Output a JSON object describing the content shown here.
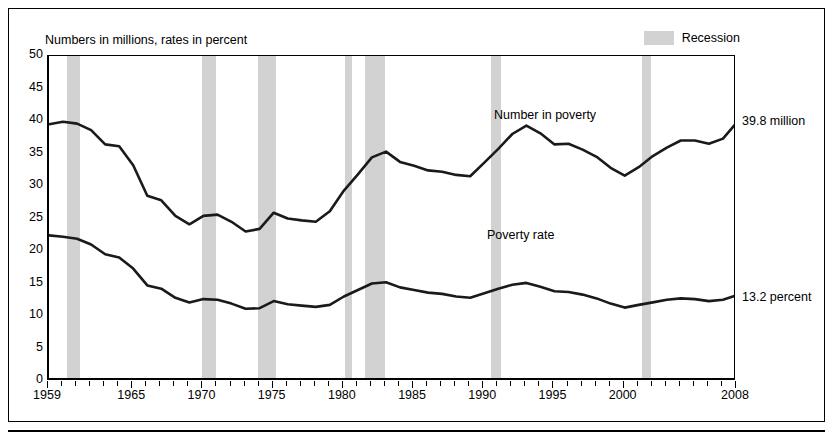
{
  "figure": {
    "subtitle": "Numbers in millions, rates in percent",
    "legend": {
      "label": "Recession",
      "swatch_color": "#d2d2d2"
    },
    "annotations": {
      "number_label": "Number in poverty",
      "rate_label": "Poverty rate",
      "number_end": "39.8 million",
      "rate_end": "13.2 percent"
    }
  },
  "chart_data": {
    "type": "line",
    "title": "",
    "subtitle": "Numbers in millions, rates in percent",
    "xlabel": "",
    "ylabel": "",
    "xlim": [
      1959,
      2008
    ],
    "ylim": [
      0,
      50
    ],
    "ytick_labels": [
      "0",
      "5",
      "10",
      "15",
      "20",
      "25",
      "30",
      "35",
      "40",
      "45",
      "50"
    ],
    "ytick_values": [
      0,
      5,
      10,
      15,
      20,
      25,
      30,
      35,
      40,
      45,
      50
    ],
    "xtick_labels": [
      "1959",
      "1965",
      "1970",
      "1975",
      "1980",
      "1985",
      "1990",
      "1995",
      "2000",
      "2008"
    ],
    "xtick_values": [
      1959,
      1965,
      1970,
      1975,
      1980,
      1985,
      1990,
      1995,
      2000,
      2008
    ],
    "grid": false,
    "legend_position": "top-right",
    "x": [
      1959,
      1960,
      1961,
      1962,
      1963,
      1964,
      1965,
      1966,
      1967,
      1968,
      1969,
      1970,
      1971,
      1972,
      1973,
      1974,
      1975,
      1976,
      1977,
      1978,
      1979,
      1980,
      1981,
      1982,
      1983,
      1984,
      1985,
      1986,
      1987,
      1988,
      1989,
      1990,
      1991,
      1992,
      1993,
      1994,
      1995,
      1996,
      1997,
      1998,
      1999,
      2000,
      2001,
      2002,
      2003,
      2004,
      2005,
      2006,
      2007,
      2008
    ],
    "series": [
      {
        "name": "Number in poverty",
        "unit": "millions",
        "end_label": "39.8 million",
        "values": [
          39.5,
          39.9,
          39.6,
          38.6,
          36.4,
          36.1,
          33.2,
          28.5,
          27.8,
          25.4,
          24.1,
          25.4,
          25.6,
          24.5,
          23.0,
          23.4,
          25.9,
          25.0,
          24.7,
          24.5,
          26.1,
          29.3,
          31.8,
          34.4,
          35.3,
          33.7,
          33.1,
          32.4,
          32.2,
          31.7,
          31.5,
          33.6,
          35.7,
          38.0,
          39.3,
          38.1,
          36.4,
          36.5,
          35.6,
          34.5,
          32.8,
          31.6,
          32.9,
          34.6,
          35.9,
          37.0,
          37.0,
          36.5,
          37.3,
          39.8
        ]
      },
      {
        "name": "Poverty rate",
        "unit": "percent",
        "end_label": "13.2 percent",
        "values": [
          22.4,
          22.2,
          21.9,
          21.0,
          19.5,
          19.0,
          17.3,
          14.7,
          14.2,
          12.8,
          12.1,
          12.6,
          12.5,
          11.9,
          11.1,
          11.2,
          12.3,
          11.8,
          11.6,
          11.4,
          11.7,
          13.0,
          14.0,
          15.0,
          15.2,
          14.4,
          14.0,
          13.6,
          13.4,
          13.0,
          12.8,
          13.5,
          14.2,
          14.8,
          15.1,
          14.5,
          13.8,
          13.7,
          13.3,
          12.7,
          11.9,
          11.3,
          11.7,
          12.1,
          12.5,
          12.7,
          12.6,
          12.3,
          12.5,
          13.2
        ]
      }
    ],
    "recessions": [
      {
        "start": 1960.3,
        "end": 1961.2
      },
      {
        "start": 1969.9,
        "end": 1970.9
      },
      {
        "start": 1973.9,
        "end": 1975.2
      },
      {
        "start": 1980.1,
        "end": 1980.6
      },
      {
        "start": 1981.5,
        "end": 1982.9
      },
      {
        "start": 1990.5,
        "end": 1991.2
      },
      {
        "start": 2001.2,
        "end": 2001.9
      },
      {
        "start": 2007.9,
        "end": 2008.6
      }
    ]
  }
}
